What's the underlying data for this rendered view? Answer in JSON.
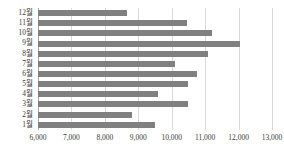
{
  "chart_data": {
    "type": "bar",
    "orientation": "horizontal",
    "title": "",
    "subtitle": "",
    "xlabel": "",
    "ylabel": "",
    "categories": [
      "12월",
      "11월",
      "10월",
      "9월",
      "8월",
      "7월",
      "6월",
      "5월",
      "4월",
      "3월",
      "2월",
      "1월"
    ],
    "values": [
      8650,
      10450,
      11200,
      12050,
      11100,
      10100,
      10750,
      10500,
      9600,
      10500,
      8800,
      9500
    ],
    "series": [
      {
        "name": "",
        "values": [
          8650,
          10450,
          11200,
          12050,
          11100,
          10100,
          10750,
          10500,
          9600,
          10500,
          8800,
          9500
        ]
      }
    ],
    "xlim": [
      6000,
      13000
    ],
    "xticks": [
      6000,
      7000,
      8000,
      9000,
      10000,
      11000,
      12000,
      13000
    ],
    "xtick_labels": [
      "6,000",
      "7,000",
      "8,000",
      "9,000",
      "10,000",
      "11,000",
      "12,000",
      "13,000"
    ],
    "grid": "vertical",
    "legend": "none",
    "bar_color": "#808080",
    "gridline_color": "#d9d9d9",
    "axis_color": "#a6a6a6",
    "text_color": "#3a3a3a"
  }
}
